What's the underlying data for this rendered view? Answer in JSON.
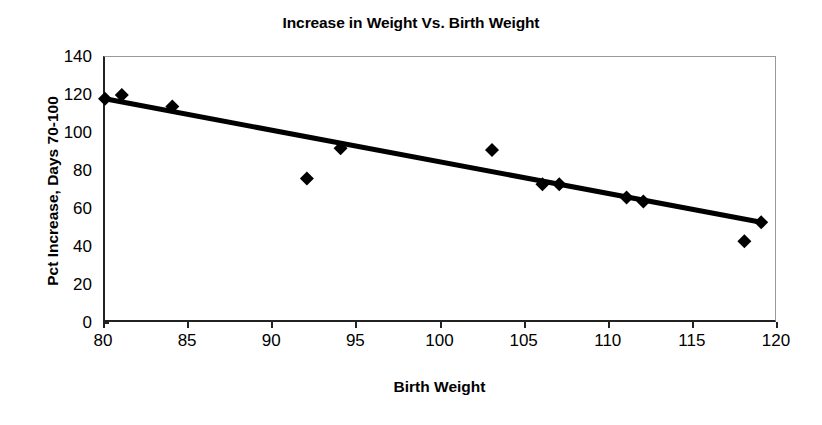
{
  "chart_data": {
    "type": "scatter",
    "title": "Increase in Weight Vs. Birth Weight",
    "xlabel": "Birth Weight",
    "ylabel": "Pct Increase, Days 70-100",
    "xlim": [
      80,
      120
    ],
    "ylim": [
      0,
      140
    ],
    "xticks": [
      80,
      85,
      90,
      95,
      100,
      105,
      110,
      115,
      120
    ],
    "yticks": [
      0,
      20,
      40,
      60,
      80,
      100,
      120,
      140
    ],
    "grid": false,
    "legend": "none",
    "marker": "filled-diamond",
    "marker_color": "#000000",
    "series": [
      {
        "name": "Pct Increase, Days 70-100",
        "points": [
          {
            "x": 80,
            "y": 118
          },
          {
            "x": 81,
            "y": 120
          },
          {
            "x": 84,
            "y": 114
          },
          {
            "x": 92,
            "y": 76
          },
          {
            "x": 94,
            "y": 92
          },
          {
            "x": 103,
            "y": 91
          },
          {
            "x": 106,
            "y": 73
          },
          {
            "x": 107,
            "y": 73
          },
          {
            "x": 111,
            "y": 66
          },
          {
            "x": 112,
            "y": 64
          },
          {
            "x": 118,
            "y": 43
          },
          {
            "x": 119,
            "y": 53
          }
        ]
      }
    ],
    "trendline": {
      "type": "linear",
      "color": "#000000",
      "x_start": 80,
      "y_start": 118,
      "x_end": 119,
      "y_end": 53
    }
  }
}
